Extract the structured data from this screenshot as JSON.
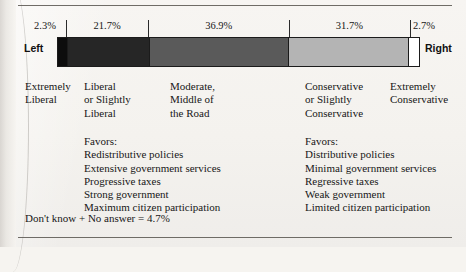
{
  "figure": {
    "left_pole_label": "Left",
    "right_pole_label": "Right",
    "footnote": "Don't know + No answer = 4.7%"
  },
  "chart_data": {
    "type": "bar",
    "orientation": "horizontal-stacked",
    "title": "",
    "xlabel": "",
    "ylabel": "",
    "units": "percent",
    "grid": false,
    "legend": "none",
    "axis_poles": {
      "left": "Left",
      "right": "Right"
    },
    "categories": [
      "Extremely Liberal",
      "Liberal or Slightly Liberal",
      "Moderate, Middle of the Road",
      "Conservative or Slightly Conservative",
      "Extremely Conservative"
    ],
    "values": [
      2.3,
      21.7,
      36.9,
      31.7,
      2.7
    ],
    "value_labels": [
      "2.3%",
      "21.7%",
      "36.9%",
      "31.7%",
      "2.7%"
    ],
    "colors": [
      "#0d0d0d",
      "#262626",
      "#5a5a5a",
      "#b4b4b4",
      "#ffffff"
    ],
    "unreported": {
      "label": "Don't know + No answer",
      "value": 4.7
    }
  },
  "segments": [
    {
      "pct": "2.3%",
      "width": 2.3,
      "color": "#0d0d0d"
    },
    {
      "pct": "21.7%",
      "width": 21.7,
      "color": "#262626"
    },
    {
      "pct": "36.9%",
      "width": 36.9,
      "color": "#5a5a5a"
    },
    {
      "pct": "31.7%",
      "width": 31.7,
      "color": "#b4b4b4"
    },
    {
      "pct": "2.7%",
      "width": 2.7,
      "color": "#ffffff"
    }
  ],
  "categories": [
    {
      "line1": "Extremely",
      "line2": "Liberal",
      "line3": ""
    },
    {
      "line1": "Liberal",
      "line2": "or Slightly",
      "line3": "Liberal"
    },
    {
      "line1": "Moderate,",
      "line2": "Middle of",
      "line3": "the Road"
    },
    {
      "line1": "Conservative",
      "line2": "or Slightly",
      "line3": "Conservative"
    },
    {
      "line1": "Extremely",
      "line2": "Conservative",
      "line3": ""
    }
  ],
  "favors_left": {
    "heading": "Favors:",
    "items": [
      "Redistributive policies",
      "Extensive government services",
      "Progressive taxes",
      "Strong government",
      "Maximum citizen participation"
    ]
  },
  "favors_right": {
    "heading": "Favors:",
    "items": [
      "Distributive policies",
      "Minimal government services",
      "Regressive taxes",
      "Weak government",
      "Limited citizen participation"
    ]
  }
}
